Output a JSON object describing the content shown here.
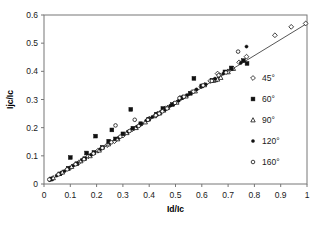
{
  "chart_data": {
    "type": "scatter",
    "title": "",
    "xlabel": "Id/Ic",
    "ylabel": "Ijc/Ic",
    "xlim": [
      0,
      1
    ],
    "ylim": [
      0,
      0.6
    ],
    "xticks": [
      "0",
      "0.1",
      "0.2",
      "0.3",
      "0.4",
      "0.5",
      "0.6",
      "0.7",
      "0.8",
      "0.9",
      "1"
    ],
    "yticks": [
      "0",
      "0.1",
      "0.2",
      "0.3",
      "0.4",
      "0.5",
      "0.6"
    ],
    "grid": false,
    "legend_position": "right-inside",
    "trendline": {
      "type": "linear",
      "slope": 0.57,
      "intercept": 0.0,
      "x_start": 0.02,
      "x_end": 1.0
    },
    "legend": [
      {
        "label": "45°",
        "marker": "diamond-open"
      },
      {
        "label": "60°",
        "marker": "square-filled"
      },
      {
        "label": "90°",
        "marker": "triangle-open"
      },
      {
        "label": "120°",
        "marker": "circle-filled"
      },
      {
        "label": "160°",
        "marker": "circle-open"
      }
    ],
    "series": [
      {
        "name": "45°",
        "marker": "diamond-open",
        "points": [
          [
            0.03,
            0.018
          ],
          [
            0.065,
            0.038
          ],
          [
            0.098,
            0.056
          ],
          [
            0.132,
            0.076
          ],
          [
            0.168,
            0.098
          ],
          [
            0.205,
            0.118
          ],
          [
            0.24,
            0.138
          ],
          [
            0.268,
            0.152
          ],
          [
            0.3,
            0.172
          ],
          [
            0.335,
            0.194
          ],
          [
            0.368,
            0.212
          ],
          [
            0.4,
            0.232
          ],
          [
            0.432,
            0.25
          ],
          [
            0.462,
            0.268
          ],
          [
            0.495,
            0.286
          ],
          [
            0.528,
            0.308
          ],
          [
            0.562,
            0.326
          ],
          [
            0.598,
            0.346
          ],
          [
            0.632,
            0.366
          ],
          [
            0.668,
            0.386
          ],
          [
            0.7,
            0.4
          ],
          [
            0.742,
            0.432
          ],
          [
            0.77,
            0.452
          ],
          [
            0.66,
            0.392
          ],
          [
            0.878,
            0.528
          ],
          [
            0.94,
            0.558
          ],
          [
            0.995,
            0.57
          ]
        ]
      },
      {
        "name": "60°",
        "marker": "square-filled",
        "points": [
          [
            0.028,
            0.018
          ],
          [
            0.06,
            0.036
          ],
          [
            0.092,
            0.056
          ],
          [
            0.1,
            0.094
          ],
          [
            0.125,
            0.072
          ],
          [
            0.155,
            0.09
          ],
          [
            0.162,
            0.11
          ],
          [
            0.19,
            0.112
          ],
          [
            0.196,
            0.17
          ],
          [
            0.222,
            0.13
          ],
          [
            0.246,
            0.152
          ],
          [
            0.258,
            0.192
          ],
          [
            0.272,
            0.16
          ],
          [
            0.3,
            0.178
          ],
          [
            0.33,
            0.265
          ],
          [
            0.338,
            0.198
          ],
          [
            0.368,
            0.214
          ],
          [
            0.398,
            0.23
          ],
          [
            0.428,
            0.248
          ],
          [
            0.452,
            0.268
          ],
          [
            0.488,
            0.282
          ],
          [
            0.522,
            0.306
          ],
          [
            0.556,
            0.322
          ],
          [
            0.57,
            0.375
          ],
          [
            0.6,
            0.348
          ],
          [
            0.64,
            0.368
          ],
          [
            0.688,
            0.398
          ],
          [
            0.712,
            0.412
          ],
          [
            0.758,
            0.438
          ],
          [
            0.772,
            0.428
          ]
        ]
      },
      {
        "name": "90°",
        "marker": "triangle-open",
        "points": [
          [
            0.035,
            0.022
          ],
          [
            0.07,
            0.042
          ],
          [
            0.105,
            0.062
          ],
          [
            0.14,
            0.082
          ],
          [
            0.175,
            0.1
          ],
          [
            0.21,
            0.12
          ],
          [
            0.245,
            0.142
          ],
          [
            0.28,
            0.16
          ],
          [
            0.315,
            0.182
          ],
          [
            0.35,
            0.2
          ],
          [
            0.385,
            0.22
          ],
          [
            0.42,
            0.242
          ],
          [
            0.44,
            0.252
          ],
          [
            0.455,
            0.262
          ],
          [
            0.47,
            0.272
          ],
          [
            0.505,
            0.29
          ],
          [
            0.54,
            0.312
          ],
          [
            0.575,
            0.33
          ],
          [
            0.61,
            0.352
          ],
          [
            0.645,
            0.368
          ],
          [
            0.652,
            0.37
          ],
          [
            0.66,
            0.372
          ],
          [
            0.672,
            0.378
          ],
          [
            0.7,
            0.398
          ],
          [
            0.72,
            0.41
          ]
        ]
      },
      {
        "name": "120°",
        "marker": "circle-filled",
        "points": [
          [
            0.022,
            0.014
          ],
          [
            0.048,
            0.03
          ],
          [
            0.078,
            0.046
          ],
          [
            0.112,
            0.066
          ],
          [
            0.145,
            0.086
          ],
          [
            0.18,
            0.104
          ],
          [
            0.215,
            0.124
          ],
          [
            0.25,
            0.146
          ],
          [
            0.285,
            0.164
          ],
          [
            0.32,
            0.186
          ],
          [
            0.355,
            0.204
          ],
          [
            0.39,
            0.226
          ],
          [
            0.412,
            0.238
          ],
          [
            0.428,
            0.246
          ],
          [
            0.445,
            0.256
          ],
          [
            0.46,
            0.264
          ],
          [
            0.48,
            0.278
          ],
          [
            0.512,
            0.296
          ],
          [
            0.545,
            0.316
          ],
          [
            0.58,
            0.336
          ],
          [
            0.615,
            0.354
          ],
          [
            0.65,
            0.374
          ],
          [
            0.682,
            0.392
          ],
          [
            0.715,
            0.408
          ],
          [
            0.748,
            0.43
          ],
          [
            0.77,
            0.488
          ]
        ]
      },
      {
        "name": "160°",
        "marker": "circle-open",
        "points": [
          [
            0.02,
            0.016
          ],
          [
            0.055,
            0.034
          ],
          [
            0.088,
            0.052
          ],
          [
            0.12,
            0.07
          ],
          [
            0.152,
            0.088
          ],
          [
            0.188,
            0.108
          ],
          [
            0.222,
            0.128
          ],
          [
            0.256,
            0.148
          ],
          [
            0.272,
            0.208
          ],
          [
            0.29,
            0.168
          ],
          [
            0.325,
            0.188
          ],
          [
            0.345,
            0.228
          ],
          [
            0.36,
            0.206
          ],
          [
            0.395,
            0.228
          ],
          [
            0.425,
            0.244
          ],
          [
            0.438,
            0.25
          ],
          [
            0.45,
            0.258
          ],
          [
            0.468,
            0.268
          ],
          [
            0.498,
            0.288
          ],
          [
            0.515,
            0.305
          ],
          [
            0.532,
            0.31
          ],
          [
            0.568,
            0.328
          ],
          [
            0.605,
            0.35
          ],
          [
            0.638,
            0.366
          ],
          [
            0.664,
            0.386
          ],
          [
            0.692,
            0.396
          ],
          [
            0.738,
            0.47
          ]
        ]
      }
    ]
  }
}
